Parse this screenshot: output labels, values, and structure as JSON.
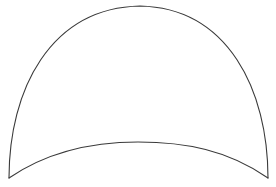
{
  "figure": {
    "background_color": "#ffffff",
    "stroke_color": "#3a3a3a",
    "shape": {
      "left_corner": [
        9,
        178
      ],
      "right_corner": [
        268,
        178
      ],
      "outer_arch_apex": [
        140,
        6
      ],
      "inner_arc_apex": [
        138,
        142
      ]
    }
  }
}
